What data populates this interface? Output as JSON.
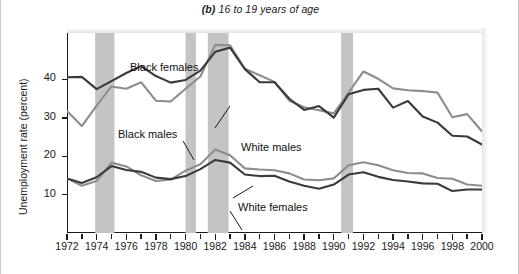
{
  "figure": {
    "panel_letter": "(b)",
    "title_rest": " 16 to 19 years of age",
    "full_title": "(b) 16 to 19 years of age"
  },
  "annotations": {
    "black_females": "Black females",
    "black_males": "Black males",
    "white_males": "White males",
    "white_females": "White females"
  },
  "colors": {
    "dark_line": "#3a3a3a",
    "gray_line": "#8d8d8d",
    "recession_band": "#c4c4c4",
    "axis": "#1b1b1b",
    "background": "#ffffff"
  },
  "chart_data": {
    "type": "line",
    "title": "(b) 16 to 19 years of age",
    "xlabel": "",
    "ylabel": "Unemployment rate (percent)",
    "xlim": [
      1972,
      2000
    ],
    "ylim": [
      0,
      52
    ],
    "yticks": [
      10,
      20,
      30,
      40
    ],
    "ytick_labels": [
      "10",
      "20",
      "30",
      "40"
    ],
    "xticks": [
      1972,
      1973,
      1974,
      1975,
      1976,
      1977,
      1978,
      1979,
      1980,
      1981,
      1982,
      1983,
      1984,
      1985,
      1986,
      1987,
      1988,
      1989,
      1990,
      1991,
      1992,
      1993,
      1994,
      1995,
      1996,
      1997,
      1998,
      1999,
      2000
    ],
    "xtick_labels": [
      "1972",
      "1974",
      "1976",
      "1978",
      "1980",
      "1982",
      "1984",
      "1986",
      "1988",
      "1990",
      "1992",
      "1994",
      "1996",
      "1998",
      "2000"
    ],
    "xtick_labeled_years": [
      1972,
      1974,
      1976,
      1978,
      1980,
      1982,
      1984,
      1986,
      1988,
      1990,
      1992,
      1994,
      1996,
      1998,
      2000
    ],
    "grid": false,
    "legend": "inline-annotations",
    "x": [
      1972,
      1973,
      1974,
      1975,
      1976,
      1977,
      1978,
      1979,
      1980,
      1981,
      1982,
      1983,
      1984,
      1985,
      1986,
      1987,
      1988,
      1989,
      1990,
      1991,
      1992,
      1993,
      1994,
      1995,
      1996,
      1997,
      1998,
      1999,
      2000
    ],
    "series": [
      {
        "name": "Black females",
        "color": "#3a3a3a",
        "values": [
          40.5,
          40.6,
          37.4,
          39.5,
          41.6,
          43.4,
          40.8,
          39.1,
          39.8,
          42.2,
          47.1,
          48.2,
          42.6,
          39.2,
          39.2,
          34.9,
          32.0,
          33.0,
          30.0,
          36.1,
          37.2,
          37.5,
          32.6,
          34.3,
          30.3,
          28.7,
          25.3,
          25.1,
          23.0
        ]
      },
      {
        "name": "Black males",
        "color": "#8d8d8d",
        "values": [
          31.7,
          27.8,
          33.1,
          38.1,
          37.5,
          39.2,
          34.4,
          34.2,
          37.5,
          40.7,
          48.9,
          48.8,
          42.7,
          41.0,
          39.3,
          34.4,
          32.7,
          31.9,
          31.1,
          36.5,
          42.0,
          40.1,
          37.6,
          37.1,
          36.9,
          36.5,
          30.1,
          30.9,
          26.4
        ]
      },
      {
        "name": "White males",
        "color": "#8d8d8d",
        "values": [
          14.2,
          12.3,
          13.5,
          18.3,
          17.3,
          15.0,
          13.5,
          13.9,
          16.2,
          17.9,
          21.7,
          20.2,
          16.8,
          16.5,
          16.3,
          15.5,
          13.9,
          13.7,
          14.2,
          17.6,
          18.4,
          17.6,
          16.3,
          15.6,
          15.5,
          14.3,
          14.1,
          12.6,
          12.3
        ]
      },
      {
        "name": "White females",
        "color": "#3a3a3a",
        "values": [
          14.2,
          13.0,
          14.5,
          17.4,
          16.4,
          15.9,
          14.4,
          14.0,
          14.8,
          16.6,
          19.0,
          18.3,
          15.2,
          14.8,
          14.9,
          13.4,
          12.3,
          11.5,
          12.6,
          15.2,
          15.8,
          14.6,
          13.8,
          13.4,
          12.9,
          12.8,
          10.9,
          11.3,
          11.3
        ]
      }
    ],
    "recession_bands": [
      {
        "start": 1973.9,
        "end": 1975.2
      },
      {
        "start": 1980.0,
        "end": 1980.7
      },
      {
        "start": 1981.5,
        "end": 1982.9
      },
      {
        "start": 1990.5,
        "end": 1991.3
      }
    ]
  }
}
